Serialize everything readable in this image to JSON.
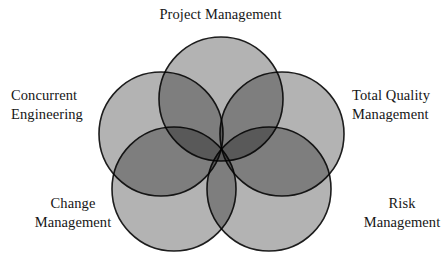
{
  "diagram": {
    "type": "venn",
    "shape": "rosette",
    "set_count": 5,
    "title": "Project Management",
    "labels": {
      "top": "Project Management",
      "upper_left": "Concurrent\nEngineering",
      "upper_right": "Total Quality\nManagement",
      "lower_left": "Change\nManagement",
      "lower_right": "Risk\nManagement"
    },
    "colors": {
      "circle_fill": "#b3b3b3",
      "circle_stroke": "#1d1d1d",
      "overlap_fill": "#5c5c5c",
      "background": "#ffffff",
      "text": "#161616"
    },
    "circles": [
      {
        "name": "project-management",
        "cx": 221,
        "cy": 99,
        "r": 62
      },
      {
        "name": "concurrent-engineering",
        "cx": 161,
        "cy": 134,
        "r": 62
      },
      {
        "name": "total-quality-management",
        "cx": 282,
        "cy": 134,
        "r": 62
      },
      {
        "name": "change-management",
        "cx": 174,
        "cy": 189,
        "r": 62
      },
      {
        "name": "risk-management",
        "cx": 269,
        "cy": 189,
        "r": 62
      }
    ]
  }
}
